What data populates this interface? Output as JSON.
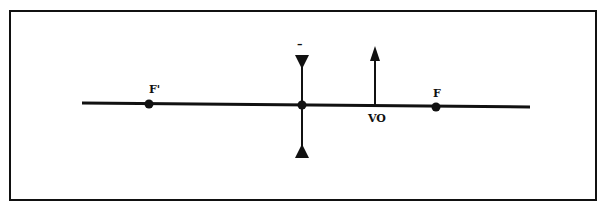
{
  "diagram": {
    "colors": {
      "ink": "#111111",
      "background": "#ffffff"
    },
    "lens": {
      "type": "diverging",
      "sign_label": "–"
    },
    "labels": {
      "focal_point_left": "F'",
      "focal_point_right": "F",
      "object": "VO"
    }
  }
}
